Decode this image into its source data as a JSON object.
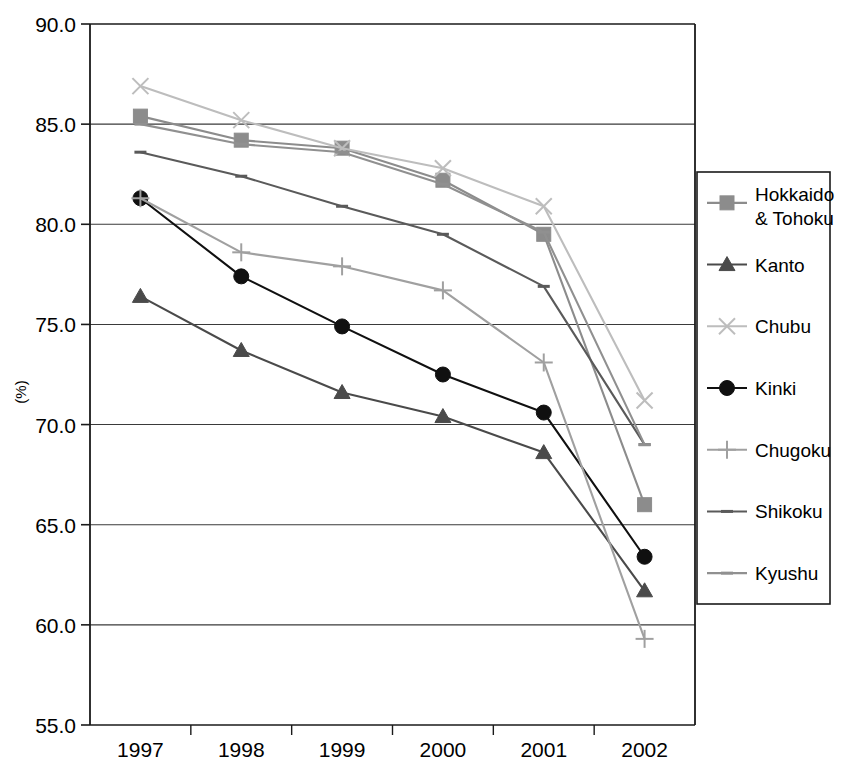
{
  "chart_data": {
    "type": "line",
    "title": "",
    "xlabel": "",
    "ylabel": "(%)",
    "categories": [
      "1997",
      "1998",
      "1999",
      "2000",
      "2001",
      "2002"
    ],
    "ylim": [
      55.0,
      90.0
    ],
    "ytick_labels": [
      "90.0",
      "85.0",
      "80.0",
      "75.0",
      "70.0",
      "65.0",
      "60.0",
      "55.0"
    ],
    "yticks": [
      90.0,
      85.0,
      80.0,
      75.0,
      70.0,
      65.0,
      60.0,
      55.0
    ],
    "grid": true,
    "grid_axis": "y",
    "legend_position": "right",
    "series": [
      {
        "name": "Hokkaido & Tohoku",
        "label": "Hokkaido\n& Tohoku",
        "marker": "square",
        "color": "#8c8c8c",
        "values": [
          85.4,
          84.2,
          83.8,
          82.2,
          79.5,
          66.0
        ]
      },
      {
        "name": "Kanto",
        "label": "Kanto",
        "marker": "triangle",
        "color": "#4a4a4a",
        "values": [
          76.4,
          73.7,
          71.6,
          70.4,
          68.6,
          61.7
        ]
      },
      {
        "name": "Chubu",
        "label": "Chubu",
        "marker": "cross",
        "color": "#bdbdbd",
        "values": [
          86.9,
          85.2,
          83.8,
          82.8,
          80.9,
          71.2
        ]
      },
      {
        "name": "Kinki",
        "label": "Kinki",
        "marker": "circle",
        "color": "#101010",
        "values": [
          81.3,
          77.4,
          74.9,
          72.5,
          70.6,
          63.4
        ]
      },
      {
        "name": "Chugoku",
        "label": "Chugoku",
        "marker": "plus",
        "color": "#a0a0a0",
        "values": [
          81.3,
          78.6,
          77.9,
          76.7,
          73.1,
          59.3
        ]
      },
      {
        "name": "Shikoku",
        "label": "Shikoku",
        "marker": "dash",
        "color": "#5a5a5a",
        "values": [
          83.6,
          82.4,
          80.9,
          79.5,
          76.9,
          69.0
        ]
      },
      {
        "name": "Kyushu",
        "label": "Kyushu",
        "marker": "dash",
        "color": "#909090",
        "values": [
          85.0,
          84.0,
          83.6,
          82.0,
          79.6,
          69.0
        ]
      }
    ]
  },
  "legend": {
    "items": [
      {
        "label_line1": "Hokkaido",
        "label_line2": "& Tohoku"
      },
      {
        "label_line1": "Kanto",
        "label_line2": ""
      },
      {
        "label_line1": "Chubu",
        "label_line2": ""
      },
      {
        "label_line1": "Kinki",
        "label_line2": ""
      },
      {
        "label_line1": "Chugoku",
        "label_line2": ""
      },
      {
        "label_line1": "Shikoku",
        "label_line2": ""
      },
      {
        "label_line1": "Kyushu",
        "label_line2": ""
      }
    ]
  },
  "axes": {
    "y_axis_title": "(%)",
    "y_labels": [
      "90.0",
      "85.0",
      "80.0",
      "75.0",
      "70.0",
      "65.0",
      "60.0",
      "55.0"
    ],
    "x_labels": [
      "1997",
      "1998",
      "1999",
      "2000",
      "2001",
      "2002"
    ]
  },
  "colors": {
    "axis": "#1a1a1a",
    "grid": "#3a3a3a",
    "background": "#ffffff"
  }
}
